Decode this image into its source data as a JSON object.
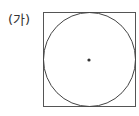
{
  "label": "(가)",
  "figure": {
    "square": {
      "x": 43,
      "y": 12,
      "size": 93
    },
    "circle": {
      "cx": 89.5,
      "cy": 58.5,
      "r": 46.5
    },
    "center_dot": {
      "cx": 89,
      "cy": 60,
      "r": 1.6
    },
    "stroke_color": "#444444"
  }
}
